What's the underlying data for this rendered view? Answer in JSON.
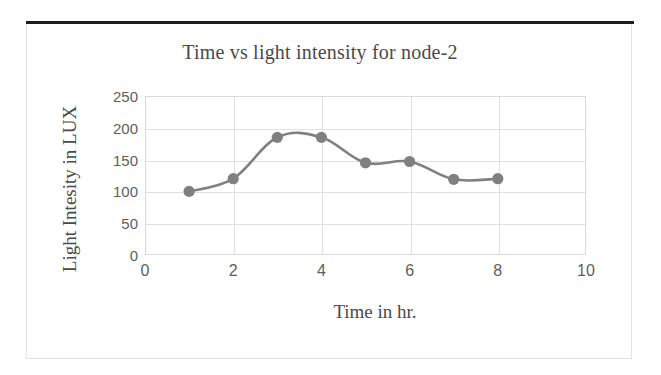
{
  "chart_data": {
    "type": "line",
    "title": "Time vs light intensity for node-2",
    "xlabel": "Time in hr.",
    "ylabel": "Light Intesity in LUX",
    "x": [
      1,
      2,
      3,
      4,
      5,
      6,
      7,
      8
    ],
    "values": [
      100,
      120,
      185,
      185,
      145,
      147,
      119,
      120
    ],
    "series": [
      {
        "name": "node-2",
        "values": [
          100,
          120,
          185,
          185,
          145,
          147,
          119,
          120
        ]
      }
    ],
    "xlim": [
      0,
      10
    ],
    "ylim": [
      0,
      250
    ],
    "x_ticks": [
      "0",
      "2",
      "4",
      "6",
      "8",
      "10"
    ],
    "x_tick_values": [
      0,
      2,
      4,
      6,
      8,
      10
    ],
    "y_ticks": [
      "0",
      "50",
      "100",
      "150",
      "200",
      "250"
    ],
    "y_tick_values": [
      0,
      50,
      100,
      150,
      200,
      250
    ],
    "grid": true,
    "legend": "none",
    "line_color": "#808080",
    "marker_color": "#808080",
    "marker_shape": "circle",
    "smoothed": true
  },
  "figure": {
    "title": "Time vs light intensity for node-2",
    "x_axis_title": "Time in hr.",
    "y_axis_title": "Light Intesity in LUX",
    "frame_color": "#e3e3e3",
    "rule_color": "#1d1d1d",
    "grid_color": "#e0e0e0",
    "text_color": "#4a4a4a",
    "tick_color": "#5e5e5e"
  }
}
